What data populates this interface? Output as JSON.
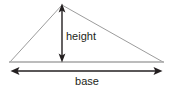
{
  "figure": {
    "background_color": "#ffffff",
    "width": 172,
    "height": 89,
    "labels": {
      "height": "height",
      "base": "base"
    },
    "colors": {
      "triangle_stroke": "#9c9c9c",
      "base_line_stroke": "#a6a6a6",
      "arrow_stroke": "#231f20",
      "text": "#231f20",
      "background": "#ffffff"
    },
    "geometry": {
      "triangle_vertices": [
        {
          "name": "left-vertex",
          "x": 10,
          "y": 62
        },
        {
          "name": "apex",
          "x": 62,
          "y": 5
        },
        {
          "name": "right-vertex",
          "x": 163,
          "y": 62
        }
      ],
      "height_arrow": {
        "x": 62,
        "y_top": 6,
        "y_bottom": 61,
        "double_headed": true
      },
      "base_arrow": {
        "y": 71,
        "x_left": 11,
        "x_right": 162,
        "double_headed": true
      }
    }
  }
}
